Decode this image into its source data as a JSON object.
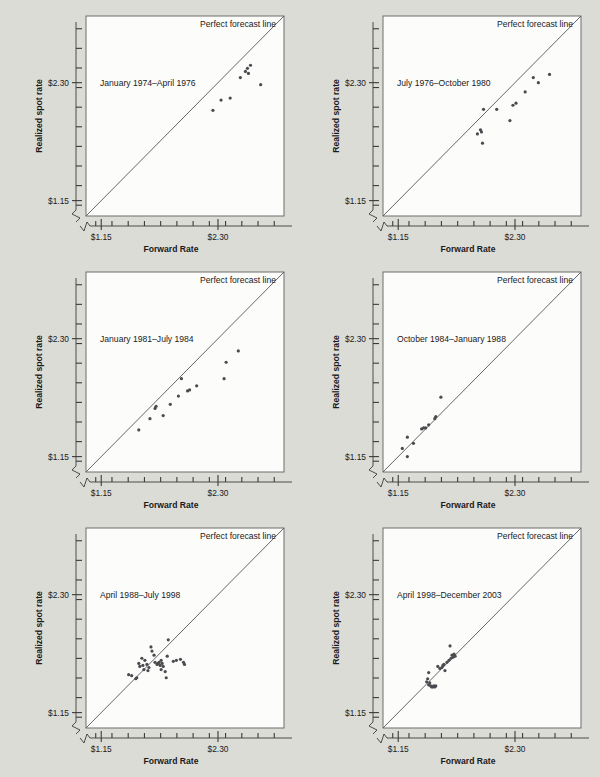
{
  "figure": {
    "background_color": "#dcdcd7",
    "panel_color": "#fcfcfb",
    "point_color": "#4a4a4f",
    "line_color": "#55565a",
    "axis_color": "#3a3a3a",
    "rows": 3,
    "cols": 2
  },
  "labels": {
    "xlabel": "Forward Rate",
    "ylabel": "Realized spot rate",
    "legend": "Perfect forecast line",
    "xticks": [
      "$1.15",
      "$2.30"
    ],
    "yticks": [
      "$2.30",
      "$1.15"
    ]
  },
  "chart_data": [
    {
      "type": "scatter",
      "title": "January 1974–April 1976",
      "xlabel": "Forward Rate",
      "ylabel": "Realized spot rate",
      "xlim": [
        1.0,
        2.95
      ],
      "ylim": [
        1.0,
        2.95
      ],
      "xticklabels": [
        "$1.15",
        "$2.30"
      ],
      "yticklabels": [
        "$1.15",
        "$2.30"
      ],
      "grid": false,
      "annotations": [
        "Perfect forecast line"
      ],
      "reference_line": {
        "label": "Perfect forecast line",
        "slope": 1,
        "intercept": 0
      },
      "points": [
        {
          "x": 2.25,
          "y": 2.03
        },
        {
          "x": 2.33,
          "y": 2.13
        },
        {
          "x": 2.42,
          "y": 2.15
        },
        {
          "x": 2.52,
          "y": 2.35
        },
        {
          "x": 2.57,
          "y": 2.41
        },
        {
          "x": 2.59,
          "y": 2.44
        },
        {
          "x": 2.6,
          "y": 2.39
        },
        {
          "x": 2.62,
          "y": 2.47
        },
        {
          "x": 2.72,
          "y": 2.28
        }
      ]
    },
    {
      "type": "scatter",
      "title": "July 1976–October 1980",
      "xlabel": "Forward Rate",
      "ylabel": "Realized spot rate",
      "xlim": [
        1.0,
        2.95
      ],
      "ylim": [
        1.0,
        2.95
      ],
      "xticklabels": [
        "$1.15",
        "$2.30"
      ],
      "yticklabels": [
        "$1.15",
        "$2.30"
      ],
      "grid": false,
      "annotations": [
        "Perfect forecast line"
      ],
      "reference_line": {
        "label": "Perfect forecast line",
        "slope": 1,
        "intercept": 0
      },
      "points": [
        {
          "x": 1.93,
          "y": 1.8
        },
        {
          "x": 1.96,
          "y": 1.84
        },
        {
          "x": 1.97,
          "y": 1.82
        },
        {
          "x": 1.98,
          "y": 1.71
        },
        {
          "x": 1.99,
          "y": 2.04
        },
        {
          "x": 2.12,
          "y": 2.04
        },
        {
          "x": 2.25,
          "y": 1.93
        },
        {
          "x": 2.28,
          "y": 2.08
        },
        {
          "x": 2.31,
          "y": 2.1
        },
        {
          "x": 2.4,
          "y": 2.21
        },
        {
          "x": 2.48,
          "y": 2.35
        },
        {
          "x": 2.53,
          "y": 2.3
        },
        {
          "x": 2.64,
          "y": 2.38
        }
      ]
    },
    {
      "type": "scatter",
      "title": "January 1981–July 1984",
      "xlabel": "Forward Rate",
      "ylabel": "Realized spot rate",
      "xlim": [
        1.0,
        2.95
      ],
      "ylim": [
        1.0,
        2.95
      ],
      "xticklabels": [
        "$1.15",
        "$2.30"
      ],
      "yticklabels": [
        "$1.15",
        "$2.30"
      ],
      "grid": false,
      "annotations": [
        "Perfect forecast line"
      ],
      "reference_line": {
        "label": "Perfect forecast line",
        "slope": 1,
        "intercept": 0
      },
      "points": [
        {
          "x": 1.52,
          "y": 1.41
        },
        {
          "x": 1.63,
          "y": 1.52
        },
        {
          "x": 1.68,
          "y": 1.62
        },
        {
          "x": 1.69,
          "y": 1.64
        },
        {
          "x": 1.76,
          "y": 1.55
        },
        {
          "x": 1.83,
          "y": 1.66
        },
        {
          "x": 1.91,
          "y": 1.74
        },
        {
          "x": 1.94,
          "y": 1.91
        },
        {
          "x": 2.0,
          "y": 1.79
        },
        {
          "x": 2.02,
          "y": 1.8
        },
        {
          "x": 2.09,
          "y": 1.84
        },
        {
          "x": 2.36,
          "y": 1.91
        },
        {
          "x": 2.38,
          "y": 2.07
        },
        {
          "x": 2.5,
          "y": 2.18
        }
      ]
    },
    {
      "type": "scatter",
      "title": "October 1984–January 1988",
      "xlabel": "Forward Rate",
      "ylabel": "Realized spot rate",
      "xlim": [
        1.0,
        2.95
      ],
      "ylim": [
        1.0,
        2.95
      ],
      "xticklabels": [
        "$1.15",
        "$2.30"
      ],
      "yticklabels": [
        "$1.15",
        "$2.30"
      ],
      "grid": false,
      "annotations": [
        "Perfect forecast line"
      ],
      "reference_line": {
        "label": "Perfect forecast line",
        "slope": 1,
        "intercept": 0
      },
      "points": [
        {
          "x": 1.19,
          "y": 1.23
        },
        {
          "x": 1.24,
          "y": 1.15
        },
        {
          "x": 1.24,
          "y": 1.34
        },
        {
          "x": 1.3,
          "y": 1.28
        },
        {
          "x": 1.38,
          "y": 1.42
        },
        {
          "x": 1.4,
          "y": 1.43
        },
        {
          "x": 1.42,
          "y": 1.43
        },
        {
          "x": 1.45,
          "y": 1.46
        },
        {
          "x": 1.51,
          "y": 1.52
        },
        {
          "x": 1.52,
          "y": 1.54
        },
        {
          "x": 1.57,
          "y": 1.73
        }
      ]
    },
    {
      "type": "scatter",
      "title": "April 1988–July 1998",
      "xlabel": "Forward Rate",
      "ylabel": "Realized spot rate",
      "xlim": [
        1.0,
        2.95
      ],
      "ylim": [
        1.0,
        2.95
      ],
      "xticklabels": [
        "$1.15",
        "$2.30"
      ],
      "yticklabels": [
        "$1.15",
        "$2.30"
      ],
      "grid": false,
      "annotations": [
        "Perfect forecast line"
      ],
      "reference_line": {
        "label": "Perfect forecast line",
        "slope": 1,
        "intercept": 0
      },
      "points": [
        {
          "x": 1.42,
          "y": 1.52
        },
        {
          "x": 1.45,
          "y": 1.51
        },
        {
          "x": 1.49,
          "y": 1.48
        },
        {
          "x": 1.5,
          "y": 1.49
        },
        {
          "x": 1.52,
          "y": 1.63
        },
        {
          "x": 1.53,
          "y": 1.6
        },
        {
          "x": 1.55,
          "y": 1.68
        },
        {
          "x": 1.56,
          "y": 1.61
        },
        {
          "x": 1.57,
          "y": 1.57
        },
        {
          "x": 1.58,
          "y": 1.66
        },
        {
          "x": 1.6,
          "y": 1.62
        },
        {
          "x": 1.61,
          "y": 1.56
        },
        {
          "x": 1.62,
          "y": 1.59
        },
        {
          "x": 1.64,
          "y": 1.79
        },
        {
          "x": 1.65,
          "y": 1.75
        },
        {
          "x": 1.67,
          "y": 1.71
        },
        {
          "x": 1.68,
          "y": 1.64
        },
        {
          "x": 1.7,
          "y": 1.62
        },
        {
          "x": 1.71,
          "y": 1.63
        },
        {
          "x": 1.72,
          "y": 1.64
        },
        {
          "x": 1.73,
          "y": 1.61
        },
        {
          "x": 1.74,
          "y": 1.66
        },
        {
          "x": 1.74,
          "y": 1.57
        },
        {
          "x": 1.75,
          "y": 1.63
        },
        {
          "x": 1.76,
          "y": 1.6
        },
        {
          "x": 1.78,
          "y": 1.55
        },
        {
          "x": 1.79,
          "y": 1.49
        },
        {
          "x": 1.8,
          "y": 1.7
        },
        {
          "x": 1.81,
          "y": 1.86
        },
        {
          "x": 1.86,
          "y": 1.65
        },
        {
          "x": 1.89,
          "y": 1.66
        },
        {
          "x": 1.93,
          "y": 1.67
        },
        {
          "x": 1.96,
          "y": 1.64
        },
        {
          "x": 1.97,
          "y": 1.62
        }
      ]
    },
    {
      "type": "scatter",
      "title": "April 1998–December 2003",
      "xlabel": "Forward Rate",
      "ylabel": "Realized spot rate",
      "xlim": [
        1.0,
        2.95
      ],
      "ylim": [
        1.0,
        2.95
      ],
      "xticklabels": [
        "$1.15",
        "$2.30"
      ],
      "yticklabels": [
        "$1.15",
        "$2.30"
      ],
      "grid": false,
      "annotations": [
        "Perfect forecast line"
      ],
      "reference_line": {
        "label": "Perfect forecast line",
        "slope": 1,
        "intercept": 0
      },
      "points": [
        {
          "x": 1.43,
          "y": 1.45
        },
        {
          "x": 1.44,
          "y": 1.48
        },
        {
          "x": 1.45,
          "y": 1.42
        },
        {
          "x": 1.45,
          "y": 1.54
        },
        {
          "x": 1.46,
          "y": 1.44
        },
        {
          "x": 1.47,
          "y": 1.41
        },
        {
          "x": 1.48,
          "y": 1.4
        },
        {
          "x": 1.49,
          "y": 1.4
        },
        {
          "x": 1.5,
          "y": 1.41
        },
        {
          "x": 1.51,
          "y": 1.4
        },
        {
          "x": 1.52,
          "y": 1.41
        },
        {
          "x": 1.54,
          "y": 1.6
        },
        {
          "x": 1.56,
          "y": 1.58
        },
        {
          "x": 1.58,
          "y": 1.59
        },
        {
          "x": 1.59,
          "y": 1.61
        },
        {
          "x": 1.6,
          "y": 1.62
        },
        {
          "x": 1.61,
          "y": 1.56
        },
        {
          "x": 1.63,
          "y": 1.64
        },
        {
          "x": 1.65,
          "y": 1.66
        },
        {
          "x": 1.67,
          "y": 1.68
        },
        {
          "x": 1.68,
          "y": 1.71
        },
        {
          "x": 1.69,
          "y": 1.69
        },
        {
          "x": 1.7,
          "y": 1.72
        },
        {
          "x": 1.71,
          "y": 1.7
        },
        {
          "x": 1.66,
          "y": 1.8
        }
      ]
    }
  ]
}
